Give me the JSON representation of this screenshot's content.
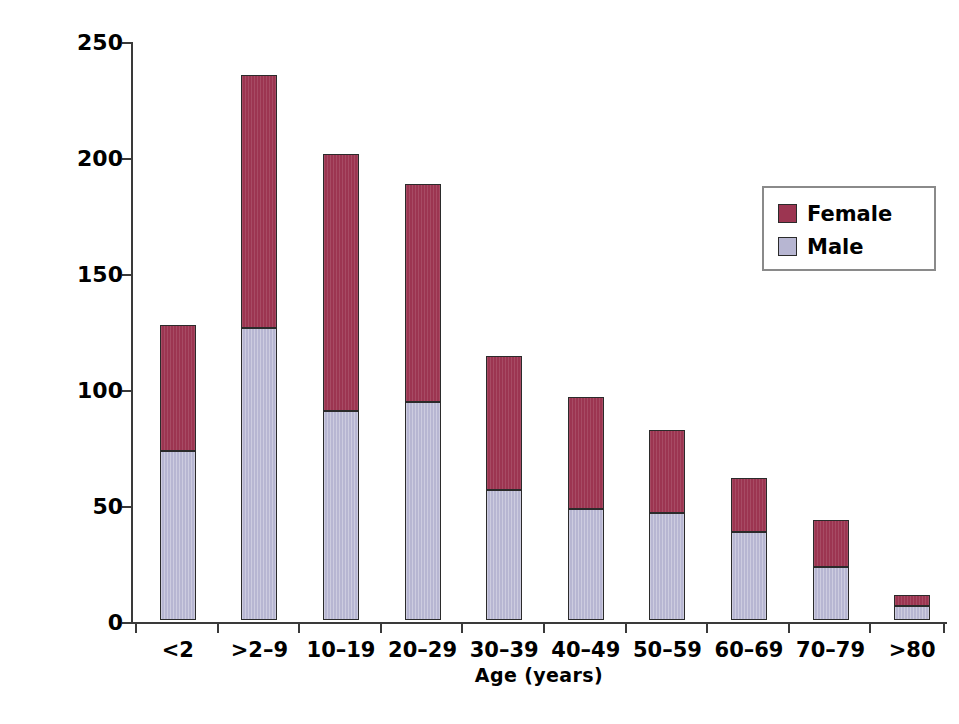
{
  "chart_data": {
    "type": "bar",
    "subtype": "stacked-vertical",
    "title": "",
    "xlabel": "Age (years)",
    "ylabel": "Number of patients",
    "categories": [
      "<2",
      ">2–9",
      "10–19",
      "20–29",
      "30–39",
      "40–49",
      "50–59",
      "60–69",
      "70–79",
      ">80"
    ],
    "series": [
      {
        "name": "Male",
        "color": "#b7b6d2",
        "values": [
          73,
          126,
          90,
          94,
          56,
          48,
          46,
          38,
          23,
          6
        ]
      },
      {
        "name": "Female",
        "color": "#9c3551",
        "values": [
          54,
          109,
          111,
          94,
          58,
          48,
          36,
          23,
          20,
          5
        ]
      }
    ],
    "totals": [
      127,
      235,
      201,
      188,
      114,
      96,
      82,
      61,
      43,
      11
    ],
    "ylim": [
      0,
      250
    ],
    "yticks": [
      0,
      50,
      100,
      150,
      200,
      250
    ],
    "ytick_labels": [
      "0",
      "50",
      "100",
      "150",
      "200",
      "250"
    ],
    "grid": false,
    "legend_position": "top-right",
    "stack_order": [
      "Male",
      "Female"
    ]
  },
  "legend": {
    "items": [
      {
        "label": "Female",
        "color": "#9c3551"
      },
      {
        "label": "Male",
        "color": "#b7b6d2"
      }
    ]
  },
  "axes": {
    "x_title": "Age (years)",
    "y_title": "Number of patients"
  },
  "colors": {
    "female": "#9c3551",
    "male": "#b7b6d2",
    "axis": "#3a3a3a",
    "bar_outline": "#2b2b2b",
    "legend_border": "#8a8a8a",
    "background": "#ffffff"
  }
}
